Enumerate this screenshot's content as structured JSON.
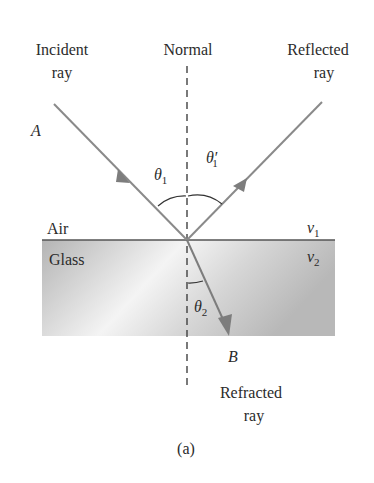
{
  "diagram": {
    "type": "refraction-reflection",
    "caption": "(a)",
    "labels": {
      "incident_line1": "Incident",
      "incident_line2": "ray",
      "normal": "Normal",
      "reflected_line1": "Reflected",
      "reflected_line2": "ray",
      "refracted_line1": "Refracted",
      "refracted_line2": "ray",
      "point_a": "A",
      "point_b": "B",
      "medium_top": "Air",
      "medium_bottom": "Glass",
      "theta1": "θ",
      "theta1_sub": "1",
      "theta1_prime": "θ′",
      "theta1_prime_sub": "1",
      "theta2": "θ",
      "theta2_sub": "2",
      "v1": "v",
      "v1_sub": "1",
      "v2": "v",
      "v2_sub": "2"
    },
    "colors": {
      "ray": "#8a8a8a",
      "glass_dark": "#b9b9b9",
      "glass_light": "#f2f2f2",
      "interface": "#555555",
      "text": "#2b2b2b"
    }
  }
}
